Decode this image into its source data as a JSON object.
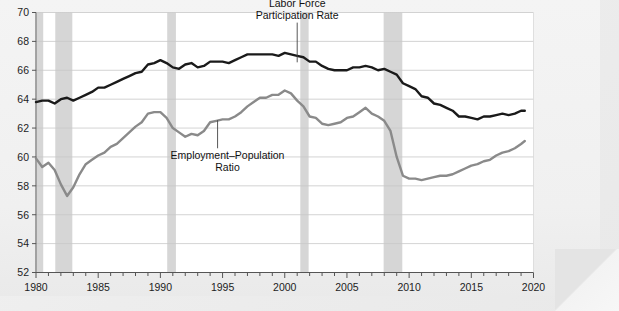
{
  "page": {
    "cropped_header_text": "",
    "background_color": "#f1f1f1"
  },
  "chart_data": {
    "type": "line",
    "title": "",
    "xlabel": "",
    "ylabel": "",
    "xlim": [
      1980,
      2020
    ],
    "ylim": [
      52,
      70
    ],
    "grid": true,
    "grid_axis": "y",
    "legend": "inline-annotations",
    "x_ticks_major": [
      "1980",
      "1985",
      "1990",
      "1995",
      "2000",
      "2005",
      "2010",
      "2015",
      "2020"
    ],
    "x_tick_minor_interval": 1,
    "y_ticks": [
      "52",
      "54",
      "56",
      "58",
      "60",
      "62",
      "64",
      "66",
      "68",
      "70"
    ],
    "y_tick_interval": 2,
    "annotations": [
      {
        "name": "labor-force-participation-rate-label",
        "text_lines": [
          "Labor Force",
          "Participation Rate"
        ],
        "anchor_x": 2001.0,
        "anchor_y": 66.55,
        "text_x": 2001.0,
        "text_y": 69.3
      },
      {
        "name": "employment-population-ratio-label",
        "text_lines": [
          "Employment–Population",
          "Ratio"
        ],
        "anchor_x": 1994.6,
        "anchor_y": 62.55,
        "text_x": 1995.4,
        "text_y": 60.6
      }
    ],
    "recession_bands": [
      {
        "name": "recession-1980",
        "start": 1980.05,
        "end": 1980.58,
        "color": "#d6d6d6"
      },
      {
        "name": "recession-1981-1982",
        "start": 1981.55,
        "end": 1982.92,
        "color": "#d6d6d6"
      },
      {
        "name": "recession-1990-1991",
        "start": 1990.55,
        "end": 1991.25,
        "color": "#d6d6d6"
      },
      {
        "name": "recession-2001",
        "start": 2001.25,
        "end": 2001.92,
        "color": "#d6d6d6"
      },
      {
        "name": "recession-2007-2009",
        "start": 2007.95,
        "end": 2009.45,
        "color": "#d6d6d6"
      }
    ],
    "series": [
      {
        "name": "Labor Force Participation Rate",
        "color": "#1a1a1a",
        "line_width": 2.4,
        "x": [
          1980.0,
          1980.5,
          1981.0,
          1981.5,
          1982.0,
          1982.5,
          1983.0,
          1983.5,
          1984.0,
          1984.5,
          1985.0,
          1985.5,
          1986.0,
          1986.5,
          1987.0,
          1987.5,
          1988.0,
          1988.5,
          1989.0,
          1989.5,
          1990.0,
          1990.5,
          1991.0,
          1991.5,
          1992.0,
          1992.5,
          1993.0,
          1993.5,
          1994.0,
          1994.5,
          1995.0,
          1995.5,
          1996.0,
          1996.5,
          1997.0,
          1997.5,
          1998.0,
          1998.5,
          1999.0,
          1999.5,
          2000.0,
          2000.5,
          2001.0,
          2001.5,
          2002.0,
          2002.5,
          2003.0,
          2003.5,
          2004.0,
          2004.5,
          2005.0,
          2005.5,
          2006.0,
          2006.5,
          2007.0,
          2007.5,
          2008.0,
          2008.5,
          2009.0,
          2009.5,
          2010.0,
          2010.5,
          2011.0,
          2011.5,
          2012.0,
          2012.5,
          2013.0,
          2013.5,
          2014.0,
          2014.5,
          2015.0,
          2015.5,
          2016.0,
          2016.5,
          2017.0,
          2017.5,
          2018.0,
          2018.5,
          2019.0,
          2019.3
        ],
        "y": [
          63.8,
          63.9,
          63.9,
          63.7,
          64.0,
          64.1,
          63.9,
          64.1,
          64.3,
          64.5,
          64.8,
          64.8,
          65.0,
          65.2,
          65.4,
          65.6,
          65.8,
          65.9,
          66.4,
          66.5,
          66.7,
          66.5,
          66.2,
          66.1,
          66.4,
          66.5,
          66.2,
          66.3,
          66.6,
          66.6,
          66.6,
          66.5,
          66.7,
          66.9,
          67.1,
          67.1,
          67.1,
          67.1,
          67.1,
          67.0,
          67.2,
          67.1,
          67.0,
          66.9,
          66.6,
          66.6,
          66.3,
          66.1,
          66.0,
          66.0,
          66.0,
          66.2,
          66.2,
          66.3,
          66.2,
          66.0,
          66.1,
          65.9,
          65.7,
          65.1,
          64.9,
          64.7,
          64.2,
          64.1,
          63.7,
          63.6,
          63.4,
          63.2,
          62.8,
          62.8,
          62.7,
          62.6,
          62.8,
          62.8,
          62.9,
          63.0,
          62.9,
          63.0,
          63.2,
          63.2
        ]
      },
      {
        "name": "Employment–Population Ratio",
        "color": "#8a8a8a",
        "line_width": 2.4,
        "x": [
          1980.0,
          1980.5,
          1981.0,
          1981.5,
          1982.0,
          1982.5,
          1983.0,
          1983.5,
          1984.0,
          1984.5,
          1985.0,
          1985.5,
          1986.0,
          1986.5,
          1987.0,
          1987.5,
          1988.0,
          1988.5,
          1989.0,
          1989.5,
          1990.0,
          1990.5,
          1991.0,
          1991.5,
          1992.0,
          1992.5,
          1993.0,
          1993.5,
          1994.0,
          1994.5,
          1995.0,
          1995.5,
          1996.0,
          1996.5,
          1997.0,
          1997.5,
          1998.0,
          1998.5,
          1999.0,
          1999.5,
          2000.0,
          2000.5,
          2001.0,
          2001.5,
          2002.0,
          2002.5,
          2003.0,
          2003.5,
          2004.0,
          2004.5,
          2005.0,
          2005.5,
          2006.0,
          2006.5,
          2007.0,
          2007.5,
          2008.0,
          2008.5,
          2009.0,
          2009.5,
          2010.0,
          2010.5,
          2011.0,
          2011.5,
          2012.0,
          2012.5,
          2013.0,
          2013.5,
          2014.0,
          2014.5,
          2015.0,
          2015.5,
          2016.0,
          2016.5,
          2017.0,
          2017.5,
          2018.0,
          2018.5,
          2019.0,
          2019.3
        ],
        "y": [
          59.9,
          59.3,
          59.6,
          59.1,
          58.1,
          57.3,
          57.9,
          58.8,
          59.5,
          59.8,
          60.1,
          60.3,
          60.7,
          60.9,
          61.3,
          61.7,
          62.1,
          62.4,
          63.0,
          63.1,
          63.1,
          62.7,
          62.0,
          61.7,
          61.4,
          61.6,
          61.5,
          61.8,
          62.4,
          62.5,
          62.6,
          62.6,
          62.8,
          63.1,
          63.5,
          63.8,
          64.1,
          64.1,
          64.3,
          64.3,
          64.6,
          64.4,
          63.9,
          63.5,
          62.8,
          62.7,
          62.3,
          62.2,
          62.3,
          62.4,
          62.7,
          62.8,
          63.1,
          63.4,
          63.0,
          62.8,
          62.5,
          61.8,
          60.0,
          58.7,
          58.5,
          58.5,
          58.4,
          58.5,
          58.6,
          58.7,
          58.7,
          58.8,
          59.0,
          59.2,
          59.4,
          59.5,
          59.7,
          59.8,
          60.1,
          60.3,
          60.4,
          60.6,
          60.9,
          61.1
        ]
      }
    ]
  }
}
